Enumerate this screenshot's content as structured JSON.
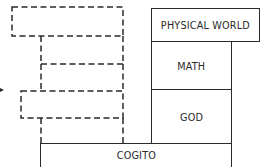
{
  "diagram": {
    "solid_blocks": [
      {
        "id": "physical-world",
        "label": "PHYSICAL WORLD"
      },
      {
        "id": "math",
        "label": "MATH"
      },
      {
        "id": "god",
        "label": "GOD"
      },
      {
        "id": "cogito",
        "label": "COGITO"
      }
    ],
    "dashed_blocks_count": 5,
    "line_color": "#2a2a2a",
    "background": "#ffffff"
  }
}
